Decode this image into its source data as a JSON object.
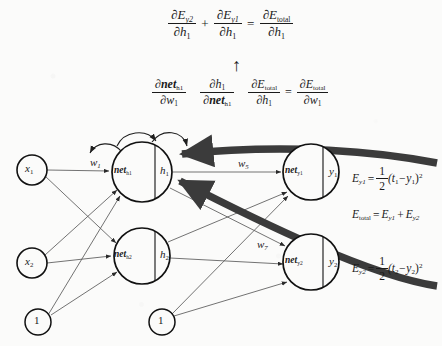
{
  "figure": {
    "type": "neural-network-backpropagation-diagram",
    "background_color": "#fbfbfa",
    "ink_color": "#1a1a1a",
    "highlight_color": "#3b3b3b"
  },
  "equations": {
    "top": {
      "term1_num": "∂E",
      "term1_num_sub": "y2",
      "term1_den": "∂h",
      "term1_den_sub": "1",
      "plus": "+",
      "term2_num": "∂E",
      "term2_num_sub": "y1",
      "term2_den": "∂h",
      "term2_den_sub": "1",
      "equals": "=",
      "term3_num": "∂E",
      "term3_num_sub": "total",
      "term3_den": "∂h",
      "term3_den_sub": "1"
    },
    "arrow_glyph": "↑",
    "chain": {
      "t1_num": "∂net",
      "t1_num_sub": "h1",
      "t1_den": "∂w",
      "t1_den_sub": "1",
      "t2_num": "∂h",
      "t2_num_sub": "1",
      "t2_den": "∂net",
      "t2_den_sub": "h1",
      "t3_num": "∂E",
      "t3_num_sub": "total",
      "t3_den": "∂h",
      "t3_den_sub": "1",
      "equals": "=",
      "t4_num": "∂E",
      "t4_num_sub": "total",
      "t4_den": "∂w",
      "t4_den_sub": "1"
    }
  },
  "network": {
    "input_nodes": [
      {
        "id": "x1",
        "label": "x",
        "sub": "1",
        "cx": 32,
        "cy": 170,
        "r": 15
      },
      {
        "id": "x2",
        "label": "x",
        "sub": "2",
        "cx": 32,
        "cy": 263,
        "r": 15
      }
    ],
    "bias_nodes": [
      {
        "id": "b1",
        "label": "1",
        "cx": 38,
        "cy": 322,
        "r": 13
      },
      {
        "id": "b2",
        "label": "1",
        "cx": 162,
        "cy": 322,
        "r": 13
      }
    ],
    "hidden_nodes": [
      {
        "id": "h1",
        "net_label": "net",
        "net_sub": "h1",
        "act_label": "h",
        "act_sub": "1",
        "cx": 142,
        "cy": 172,
        "r": 30
      },
      {
        "id": "h2",
        "net_label": "net",
        "net_sub": "h2",
        "act_label": "h",
        "act_sub": "2",
        "cx": 142,
        "cy": 256,
        "r": 28
      }
    ],
    "output_nodes": [
      {
        "id": "y1",
        "net_label": "net",
        "net_sub": "y1",
        "act_label": "y",
        "act_sub": "1",
        "cx": 311,
        "cy": 172,
        "r": 28
      },
      {
        "id": "y2",
        "net_label": "net",
        "net_sub": "y2",
        "act_label": "y",
        "act_sub": "2",
        "cx": 311,
        "cy": 262,
        "r": 28
      }
    ],
    "weight_labels": [
      {
        "id": "w1",
        "label": "w",
        "sub": "1",
        "x": 90,
        "y": 156
      },
      {
        "id": "w5",
        "label": "w",
        "sub": "5",
        "x": 238,
        "y": 157
      },
      {
        "id": "w7",
        "label": "w",
        "sub": "7",
        "x": 257,
        "y": 238
      }
    ]
  },
  "error_equations": {
    "e_y1": {
      "lhs": "E",
      "lhs_sub": "y1",
      "eq": "=",
      "frac_num": "1",
      "frac_den": "2",
      "rhs": "(t",
      "rhs_sub1": "1",
      "minus": "−y",
      "rhs_sub2": "1",
      "close": ")",
      "power": "2",
      "x": 352,
      "y": 165
    },
    "e_total": {
      "lhs": "E",
      "lhs_sub": "total",
      "eq": "=",
      "term1": "E",
      "term1_sub": "y1",
      "plus": "+",
      "term2": "E",
      "term2_sub": "y2",
      "x": 352,
      "y": 208
    },
    "e_y2": {
      "lhs": "E",
      "lhs_sub": "y2",
      "eq": "=",
      "frac_num": "1",
      "frac_den": "2",
      "rhs": "(t",
      "rhs_sub1": "2",
      "minus": "−y",
      "rhs_sub2": "2",
      "close": ")",
      "power": "2",
      "x": 352,
      "y": 255
    }
  }
}
